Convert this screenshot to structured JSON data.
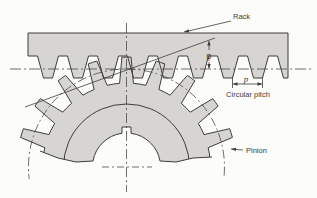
{
  "figure": {
    "labels": {
      "rack": "Rack",
      "pinion": "Pinion",
      "pitch_symbol": "p",
      "pressure_angle": "φ",
      "circular_pitch": "Circular pitch"
    },
    "colors": {
      "background": "#fcfcfa",
      "body_fill": "#d6d5d2",
      "line": "#3e3d39",
      "centerline": "#4a4946",
      "text": "#3e3d39"
    },
    "geometry": {
      "width": 317,
      "height": 198,
      "rack": {
        "left": 28,
        "right": 288,
        "top_y": 33,
        "root_y": 56,
        "tip_y": 78,
        "pitch": 30,
        "first_center": 48,
        "tip_half": 4.5,
        "root_half": 10.5
      },
      "gear": {
        "cx": 126.5,
        "cy": 167,
        "r_add": 110,
        "r_root": 84,
        "r_pitch": 98,
        "r_rim": 63,
        "r_bore": 34,
        "teeth": 20,
        "top_angle": 90,
        "tip_half_deg": 2.4,
        "root_half_deg": 4.7,
        "key_half_w": 4.5,
        "key_top_y": 127,
        "bore_chord_y": 161
      },
      "pitch_line": {
        "x1": 10,
        "x2": 313,
        "y": 69
      },
      "vertical_centerline": {
        "x": 126.5,
        "y1": 23,
        "y2": 192
      },
      "center_cross": {
        "x1": 102,
        "x2": 152,
        "y": 167
      },
      "pitch_arc": {
        "start_deg": -5,
        "end_deg": 187
      },
      "pressure_line": {
        "x1": 25,
        "y1": 107,
        "x2": 215,
        "y2": 38
      },
      "break_left": [
        [
          40,
          151
        ],
        [
          58,
          158
        ],
        [
          76,
          162
        ],
        [
          93,
          161
        ]
      ],
      "break_right": [
        [
          160,
          161
        ],
        [
          176,
          162
        ],
        [
          193,
          158
        ],
        [
          212,
          157
        ]
      ],
      "phi_dim": {
        "x": 209,
        "top": 40.5,
        "bottom": 69,
        "gap_top": 50,
        "gap_bottom": 62
      },
      "p_dim": {
        "x1": 232.5,
        "x2": 262.5,
        "y": 84,
        "ext_top": 77,
        "ext_bottom": 88
      },
      "rack_leader": {
        "x1": 231,
        "y1": 21,
        "x2": 184,
        "y2": 32
      },
      "pinion_leader": {
        "x1": 243,
        "y1": 150,
        "x2": 231,
        "y2": 149
      }
    }
  }
}
